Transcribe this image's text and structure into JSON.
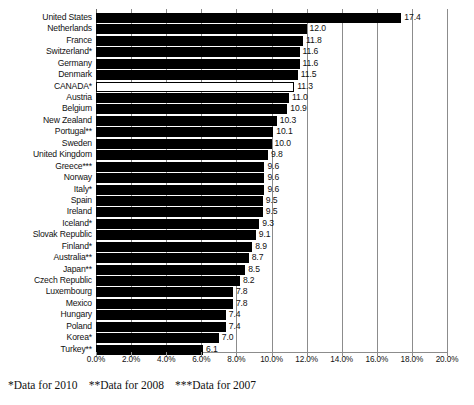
{
  "chart_data": {
    "type": "bar",
    "orientation": "horizontal",
    "title": "",
    "subtitle": "",
    "xlabel": "",
    "ylabel": "",
    "xlim": [
      0,
      20
    ],
    "grid": true,
    "legend": "none",
    "xtick_labels": [
      "0.0%",
      "2.0%",
      "4.0%",
      "6.0%",
      "8.0%",
      "10.0%",
      "12.0%",
      "14.0%",
      "16.0%",
      "18.0%",
      "20.0%"
    ],
    "xtick_values": [
      0,
      2,
      4,
      6,
      8,
      10,
      12,
      14,
      16,
      18,
      20
    ],
    "value_format": "one-decimal",
    "categories": [
      "United States",
      "Netherlands",
      "France",
      "Switzerland*",
      "Germany",
      "Denmark",
      "CANADA*",
      "Austria",
      "Belgium",
      "New Zealand",
      "Portugal**",
      "Sweden",
      "United Kingdom",
      "Greece***",
      "Norway",
      "Italy*",
      "Spain",
      "Ireland",
      "Iceland*",
      "Slovak Republic",
      "Finland*",
      "Australia**",
      "Japan**",
      "Czech Republic",
      "Luxembourg",
      "Mexico",
      "Hungary",
      "Poland",
      "Korea*",
      "Turkey**"
    ],
    "values": [
      17.4,
      12.0,
      11.8,
      11.6,
      11.6,
      11.5,
      11.3,
      11.0,
      10.9,
      10.3,
      10.1,
      10.0,
      9.8,
      9.6,
      9.6,
      9.6,
      9.5,
      9.5,
      9.3,
      9.1,
      8.9,
      8.7,
      8.5,
      8.2,
      7.8,
      7.8,
      7.4,
      7.4,
      7.0,
      6.1
    ],
    "value_labels": [
      "17.4",
      "12.0",
      "11.8",
      "11.6",
      "11.6",
      "11.5",
      "11.3",
      "11.0",
      "10.9",
      "10.3",
      "10.1",
      "10.0",
      "9.8",
      "9.6",
      "9.6",
      "9.6",
      "9.5",
      "9.5",
      "9.3",
      "9.1",
      "8.9",
      "8.7",
      "8.5",
      "8.2",
      "7.8",
      "7.8",
      "7.4",
      "7.4",
      "7.0",
      "6.1"
    ],
    "highlighted_category": "CANADA*",
    "bar_color": "#000000",
    "highlight_bar_fill": "#ffffff",
    "highlight_bar_stroke": "#000000",
    "gridline_color": "#8c8c8c"
  },
  "footnote": {
    "note_2010": "*Data for 2010",
    "note_2008": "**Data for 2008",
    "note_2007": "***Data for 2007"
  }
}
